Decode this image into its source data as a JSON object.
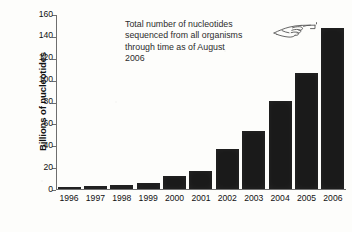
{
  "chart_data": {
    "type": "bar",
    "title": "",
    "subtitle": "",
    "xlabel": "",
    "ylabel": "Billions of nucleotides",
    "categories": [
      "1996",
      "1997",
      "1998",
      "1999",
      "2000",
      "2001",
      "2002",
      "2003",
      "2004",
      "2005",
      "2006"
    ],
    "values": [
      1,
      2,
      3,
      5.5,
      11.5,
      16.5,
      36.5,
      53,
      80.5,
      105.5,
      147
    ],
    "ylim": [
      0,
      160
    ],
    "yticks": [
      0,
      20,
      40,
      60,
      80,
      100,
      120,
      140,
      160
    ],
    "ytick_labels": [
      "0",
      "20",
      "40",
      "60",
      "80",
      "100",
      "120",
      "140",
      "160"
    ],
    "grid": false,
    "legend": null,
    "bar_color": "#1a1a1a",
    "axis_color": "#6e6e6e",
    "annotations": [
      {
        "name": "callout",
        "lines": [
          "Total number of nucleotides",
          "sequenced from all organisms",
          "through time as of August",
          "2006"
        ],
        "icon": "pointing-hand-right-icon"
      }
    ]
  },
  "axes": {
    "y_title": "Billions of nucleotides"
  },
  "colors": {
    "bar": "#1a1a1a",
    "axis": "#6e6e6e",
    "text": "#111111",
    "annotation_text": "#2c2c2c",
    "background": "#fdfdfb"
  }
}
